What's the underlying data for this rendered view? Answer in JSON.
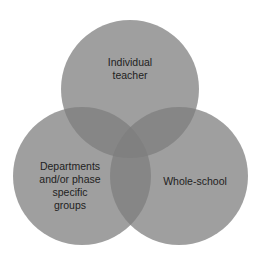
{
  "diagram": {
    "type": "venn",
    "sets": [
      {
        "id": "top",
        "label": "Individual\nteacher",
        "cx": 130,
        "cy": 89,
        "r": 69
      },
      {
        "id": "left",
        "label": "Departments\nand/or phase\nspecific\ngroups",
        "cx": 82,
        "cy": 176,
        "r": 69
      },
      {
        "id": "right",
        "label": "Whole-school",
        "cx": 179,
        "cy": 176,
        "r": 69
      }
    ],
    "colors": {
      "single": "#9f9f9f",
      "double_overlap": "#8a8a8a",
      "triple_overlap": "#7a7a7a",
      "text": "#1e1e1e",
      "background": "#ffffff"
    }
  }
}
